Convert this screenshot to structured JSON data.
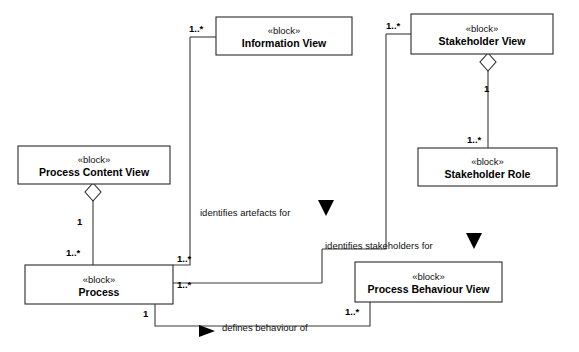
{
  "diagram": {
    "stereotype": "«block»",
    "background_color": "#ffffff",
    "line_color": "#3a3a3a",
    "text_color": "#000000",
    "blocks": [
      {
        "id": "information-view",
        "stereotype": "«block»",
        "name": "Information View",
        "x": 216,
        "y": 17,
        "width": 136,
        "height": 38
      },
      {
        "id": "stakeholder-view",
        "stereotype": "«block»",
        "name": "Stakeholder View",
        "x": 411,
        "y": 14,
        "width": 142,
        "height": 40
      },
      {
        "id": "stakeholder-role",
        "stereotype": "«block»",
        "name": "Stakeholder Role",
        "x": 418,
        "y": 148,
        "width": 139,
        "height": 38
      },
      {
        "id": "process-content-view",
        "stereotype": "«block»",
        "name": "Process Content View",
        "x": 18,
        "y": 146,
        "width": 152,
        "height": 38
      },
      {
        "id": "process",
        "stereotype": "«block»",
        "name": "Process",
        "x": 25,
        "y": 265,
        "width": 148,
        "height": 39
      },
      {
        "id": "process-behaviour-view",
        "stereotype": "«block»",
        "name": "Process Behaviour View",
        "x": 355,
        "y": 262,
        "width": 147,
        "height": 40
      }
    ],
    "multiplicities": [
      {
        "id": "info-view-left",
        "text": "1..*",
        "x": 189,
        "y": 32
      },
      {
        "id": "stakeholder-view-left",
        "text": "1..*",
        "x": 386,
        "y": 29
      },
      {
        "id": "stakeholder-view-agg",
        "text": "1",
        "x": 484,
        "y": 92
      },
      {
        "id": "stakeholder-role-top",
        "text": "1..*",
        "x": 467,
        "y": 143
      },
      {
        "id": "process-content-agg",
        "text": "1",
        "x": 77,
        "y": 225
      },
      {
        "id": "process-top-left",
        "text": "1..*",
        "x": 66,
        "y": 256
      },
      {
        "id": "process-right-upper",
        "text": "1..*",
        "x": 177,
        "y": 262
      },
      {
        "id": "process-right-lower",
        "text": "1..*",
        "x": 177,
        "y": 288
      },
      {
        "id": "process-bottom",
        "text": "1",
        "x": 143,
        "y": 317
      },
      {
        "id": "behaviour-view-bottom-left",
        "text": "1..*",
        "x": 345,
        "y": 315
      }
    ],
    "association_labels": [
      {
        "id": "identifies-artefacts-for",
        "text": "identifies artefacts for",
        "x": 200,
        "y": 216
      },
      {
        "id": "identifies-stakeholders-for",
        "text": "identifies stakeholders for",
        "x": 325,
        "y": 249
      },
      {
        "id": "defines-behaviour-of",
        "text": "defines behaviour of",
        "x": 222,
        "y": 331
      }
    ],
    "connections": [
      {
        "id": "process-to-information-view",
        "path": "M 190 37 L 190 265 L 173 265"
      },
      {
        "id": "information-view-stub",
        "path": "M 190 37 L 216 37"
      },
      {
        "id": "process-to-stakeholder-view",
        "path": "M 386 34 L 386 249 L 322 249"
      },
      {
        "id": "stakeholder-view-stub",
        "path": "M 386 34 L 411 34"
      },
      {
        "id": "stakeholder-view-to-role",
        "path": "M 488 54 L 488 148"
      },
      {
        "id": "content-view-to-process",
        "path": "M 93 184 L 93 265"
      },
      {
        "id": "process-to-behaviour-right",
        "path": "M 173 283 L 322 283"
      },
      {
        "id": "artefacts-drop",
        "path": "M 322 249 L 322 283"
      },
      {
        "id": "behaviour-view-left-stub",
        "path": "M 370 283 L 355 283"
      },
      {
        "id": "process-bottom-to-behaviour",
        "path": "M 155 304 L 155 326 L 370 326 L 370 302"
      }
    ],
    "diamonds": [
      {
        "id": "process-content-view-aggregation",
        "cx": 93,
        "cy": 192,
        "rx": 8,
        "ry": 9
      },
      {
        "id": "stakeholder-view-aggregation",
        "cx": 488,
        "cy": 62,
        "rx": 8,
        "ry": 9
      }
    ],
    "arrows": [
      {
        "id": "artefacts-direction-arrow",
        "points": "318,200 334,200 326,216",
        "orientation": "down"
      },
      {
        "id": "stakeholders-direction-arrow",
        "points": "466,233 482,233 474,249",
        "orientation": "down"
      },
      {
        "id": "defines-behaviour-arrow",
        "points": "215,331 199,325 199,337",
        "orientation": "left"
      }
    ]
  }
}
